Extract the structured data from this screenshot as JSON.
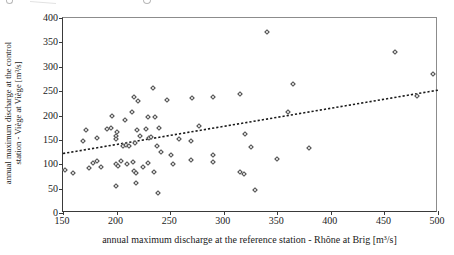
{
  "figure": {
    "xlabel": "annual maximum discharge at the reference station - Rhône at Brig  [m³/s]",
    "ylabel_line1": "annual maximum discharge at the control",
    "ylabel_line2": "station - Viège at Viège [m³/s]"
  },
  "chart_data": {
    "type": "scatter",
    "title": "",
    "xlabel": "annual maximum discharge at the reference station - Rhône at Brig  [m³/s]",
    "ylabel": "annual maximum discharge at the control station - Viège at Viège [m³/s]",
    "xlim": [
      150,
      500
    ],
    "ylim": [
      0,
      400
    ],
    "xticks": [
      150,
      200,
      250,
      300,
      350,
      400,
      450,
      500
    ],
    "yticks": [
      0,
      50,
      100,
      150,
      200,
      250,
      300,
      350,
      400
    ],
    "grid": false,
    "legend": "none",
    "marker": {
      "shape": "diamond-outline",
      "color": "#4a4a4a",
      "size_px": 4
    },
    "trendline": {
      "style": "dotted",
      "color": "#1a1a1a",
      "x1": 150,
      "y1": 122,
      "x2": 500,
      "y2": 252
    },
    "points": [
      [
        340,
        372
      ],
      [
        460,
        330
      ],
      [
        495,
        285
      ],
      [
        480,
        240
      ],
      [
        365,
        265
      ],
      [
        234,
        256
      ],
      [
        270,
        236
      ],
      [
        290,
        237
      ],
      [
        315,
        245
      ],
      [
        216,
        238
      ],
      [
        220,
        229
      ],
      [
        247,
        231
      ],
      [
        196,
        198
      ],
      [
        214,
        208
      ],
      [
        208,
        190
      ],
      [
        229,
        196
      ],
      [
        236,
        197
      ],
      [
        360,
        208
      ],
      [
        240,
        174
      ],
      [
        219,
        170
      ],
      [
        227,
        172
      ],
      [
        191,
        172
      ],
      [
        195,
        175
      ],
      [
        171,
        170
      ],
      [
        169,
        148
      ],
      [
        182,
        153
      ],
      [
        200,
        167
      ],
      [
        199,
        157
      ],
      [
        199,
        151
      ],
      [
        277,
        179
      ],
      [
        320,
        163
      ],
      [
        258,
        151
      ],
      [
        269,
        148
      ],
      [
        251,
        118
      ],
      [
        206,
        138
      ],
      [
        209,
        140
      ],
      [
        212,
        137
      ],
      [
        217,
        144
      ],
      [
        222,
        157
      ],
      [
        230,
        153
      ],
      [
        232,
        155
      ],
      [
        238,
        137
      ],
      [
        241,
        126
      ],
      [
        325,
        135
      ],
      [
        380,
        133
      ],
      [
        350,
        110
      ],
      [
        152,
        88
      ],
      [
        159,
        82
      ],
      [
        174,
        93
      ],
      [
        178,
        103
      ],
      [
        182,
        106
      ],
      [
        185,
        95
      ],
      [
        199,
        101
      ],
      [
        201,
        96
      ],
      [
        204,
        106
      ],
      [
        210,
        100
      ],
      [
        215,
        105
      ],
      [
        216,
        86
      ],
      [
        218,
        82
      ],
      [
        225,
        94
      ],
      [
        229,
        102
      ],
      [
        235,
        85
      ],
      [
        253,
        100
      ],
      [
        269,
        108
      ],
      [
        290,
        119
      ],
      [
        290,
        105
      ],
      [
        315,
        85
      ],
      [
        319,
        80
      ],
      [
        199,
        55
      ],
      [
        218,
        61
      ],
      [
        239,
        41
      ],
      [
        329,
        48
      ]
    ]
  }
}
